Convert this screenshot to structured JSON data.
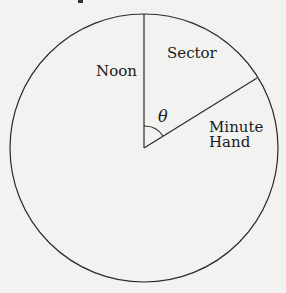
{
  "diagram": {
    "type": "clock-sector",
    "circle": {
      "cx": 144,
      "cy": 148,
      "r": 134
    },
    "labels": {
      "noon": "Noon",
      "sector": "Sector",
      "minute_hand_line1": "Minute",
      "minute_hand_line2": "Hand",
      "angle": "θ"
    },
    "colors": {
      "stroke": "#2a2a2a",
      "background": "#f2f2f0",
      "text": "#1a1a1a"
    }
  }
}
